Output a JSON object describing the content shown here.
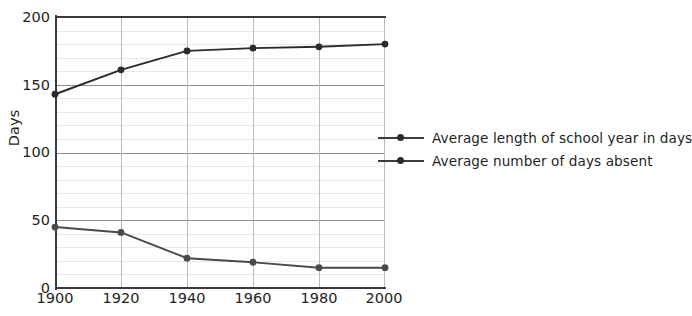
{
  "chart_data": {
    "type": "line",
    "title": "",
    "xlabel": "",
    "ylabel": "Days",
    "x": [
      1900,
      1920,
      1940,
      1960,
      1980,
      2000
    ],
    "categories": [
      "1900",
      "1920",
      "1940",
      "1960",
      "1980",
      "2000"
    ],
    "xlim": [
      1900,
      2000
    ],
    "ylim": [
      0,
      200
    ],
    "y_ticks": [
      0,
      50,
      100,
      150,
      200
    ],
    "y_tick_labels": [
      "0",
      "50",
      "100",
      "150",
      "200"
    ],
    "y_minor_step": 10,
    "grid": true,
    "legend_position": "right",
    "series": [
      {
        "name": "Average length of school year in days",
        "values": [
          143,
          161,
          175,
          177,
          178,
          180
        ],
        "color": "#2b2b2d",
        "marker": "circle"
      },
      {
        "name": "Average number of days absent",
        "values": [
          45,
          41,
          22,
          19,
          15,
          15
        ],
        "color": "#4a4a4c",
        "marker": "circle"
      }
    ]
  },
  "axes": {
    "y_title": "Days",
    "y_tick_labels": [
      "200",
      "150",
      "100",
      "50",
      "0"
    ],
    "x_tick_labels": [
      "1900",
      "1920",
      "1940",
      "1960",
      "1980",
      "2000"
    ]
  },
  "legend": {
    "items": [
      {
        "label": "Average length of school year in days"
      },
      {
        "label": "Average number of days absent"
      }
    ]
  },
  "colors": {
    "background": "#ffffff",
    "axis": "#3a3a3c",
    "grid_major": "#8d8d8f",
    "grid_minor": "#e9e9ea",
    "grid_vertical": "#b9b9bb",
    "series_1": "#2b2b2d",
    "series_2": "#4a4a4c",
    "text": "#231f20"
  }
}
